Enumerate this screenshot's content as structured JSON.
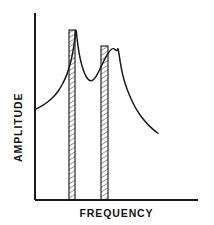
{
  "figure": {
    "background_color": "#ffffff",
    "ink_color": "#151515",
    "width": 214,
    "height": 225
  },
  "axes": {
    "y_label": "AMPLITUDE",
    "x_label": "FREQUENCY",
    "origin_x": 35,
    "origin_y": 200,
    "y_axis_top": 13,
    "x_axis_right": 198,
    "show_ticks": false,
    "show_tick_labels": false,
    "show_grid": false
  },
  "chart_data": {
    "type": "line",
    "title": "",
    "subtitle": "",
    "xlabel": "FREQUENCY",
    "ylabel": "AMPLITUDE",
    "xlim": [
      0,
      1
    ],
    "ylim": [
      0,
      1
    ],
    "grid": false,
    "legend": null,
    "axis_tick_labels": {
      "x": [],
      "y": []
    },
    "series": [
      {
        "name": "Amplitude response",
        "x": [
          0.0,
          0.04,
          0.085,
          0.13,
          0.17,
          0.205,
          0.235,
          0.26,
          0.28,
          0.3,
          0.316,
          0.327,
          0.333,
          0.34,
          0.352,
          0.37,
          0.395,
          0.42,
          0.45,
          0.48,
          0.51,
          0.54,
          0.57,
          0.6,
          0.625,
          0.645,
          0.66,
          0.668,
          0.675,
          0.685,
          0.7,
          0.722,
          0.75,
          0.785,
          0.825,
          0.87,
          0.915,
          0.96,
          1.0
        ],
        "y": [
          0.525,
          0.54,
          0.56,
          0.585,
          0.615,
          0.65,
          0.69,
          0.73,
          0.775,
          0.83,
          0.895,
          0.955,
          1.0,
          0.95,
          0.88,
          0.81,
          0.748,
          0.71,
          0.69,
          0.7,
          0.735,
          0.78,
          0.825,
          0.86,
          0.88,
          0.88,
          0.868,
          0.872,
          0.885,
          0.84,
          0.77,
          0.7,
          0.64,
          0.58,
          0.525,
          0.478,
          0.44,
          0.41,
          0.388
        ]
      }
    ],
    "peaks": [
      {
        "label": "peak-1",
        "x": 0.333,
        "y": 1.0,
        "pixel_x": 72,
        "pixel_y": 28
      },
      {
        "label": "peak-2",
        "x": 0.675,
        "y": 0.885,
        "pixel_x": 100,
        "pixel_y": 43
      }
    ],
    "valley": {
      "label": "valley",
      "x": 0.45,
      "y": 0.69,
      "pixel_x": 88,
      "pixel_y": 62
    },
    "hatched_bands": [
      {
        "label": "resonance-band-1",
        "x_start": 0.298,
        "x_end": 0.368,
        "pixel_x_start": 69,
        "pixel_x_end": 75,
        "pixel_top": 30,
        "pixel_bottom": 200,
        "hatch": "diagonal"
      },
      {
        "label": "resonance-band-2",
        "x_start": 0.64,
        "x_end": 0.725,
        "pixel_x_start": 101,
        "pixel_x_end": 108,
        "pixel_top": 46,
        "pixel_bottom": 200,
        "hatch": "diagonal"
      }
    ]
  }
}
